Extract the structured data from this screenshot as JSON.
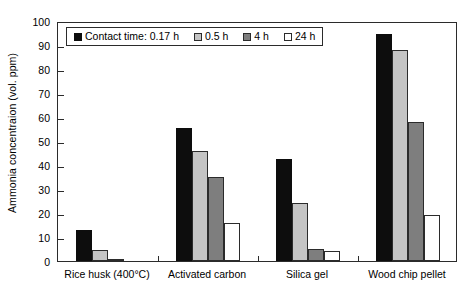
{
  "chart_data": {
    "type": "bar",
    "title": "",
    "xlabel": "",
    "ylabel": "Ammonia concentraion (vol. ppm)",
    "ylim": [
      0,
      100
    ],
    "ytick_step": 10,
    "grid": false,
    "legend_position": "top-left",
    "legend_inside_box": true,
    "categories": [
      "Rice husk (400°C)",
      "Activated carbon",
      "Silica gel",
      "Wood chip pellet"
    ],
    "yticks": [
      "0",
      "10",
      "20",
      "30",
      "40",
      "50",
      "60",
      "70",
      "80",
      "90",
      "100"
    ],
    "series": [
      {
        "name": "Contact time: 0.17 h",
        "color": "#0d0d0d",
        "values": [
          13,
          55.5,
          42.5,
          94.7
        ]
      },
      {
        "name": "0.5 h",
        "color": "#c4c4c4",
        "values": [
          4.5,
          46,
          24,
          88
        ]
      },
      {
        "name": "4 h",
        "color": "#7e7e7e",
        "values": [
          1,
          35.2,
          4.8,
          57.8
        ]
      },
      {
        "name": "24 h",
        "color": "#ffffff",
        "values": [
          0,
          15.8,
          4.2,
          19.2
        ]
      }
    ]
  },
  "axis": {
    "y_title": "Ammonia concentraion (vol. ppm)",
    "y_max_label": "100",
    "y_min_label": "0"
  },
  "colors": {
    "frame": "#2b2b2b",
    "series_0": "#0d0d0d",
    "series_1": "#c4c4c4",
    "series_2": "#7e7e7e",
    "series_3": "#ffffff",
    "background": "#ffffff"
  }
}
